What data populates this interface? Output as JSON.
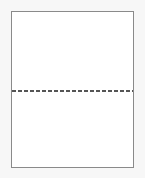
{
  "document": {
    "title": "Blank perforated sheet",
    "orientation": "portrait",
    "background_color": "#f7f7f7",
    "paper_color": "#ffffff",
    "border_color": "#8a8a8a",
    "perforation_color": "#555555"
  },
  "sheet": {
    "label": "",
    "top_panel": {
      "label": "",
      "content": ""
    },
    "perforation": {
      "label": "",
      "style": "dashed",
      "orientation": "horizontal"
    },
    "bottom_panel": {
      "label": "",
      "content": ""
    }
  }
}
